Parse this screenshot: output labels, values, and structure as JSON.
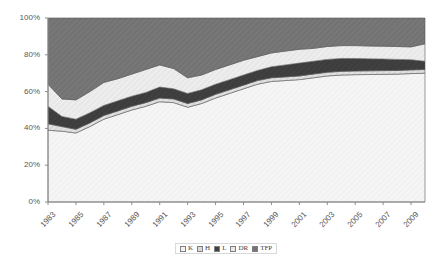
{
  "chart_data": {
    "type": "area",
    "stacked": true,
    "title": "",
    "xlabel": "",
    "ylabel": "",
    "ylim": [
      0,
      100
    ],
    "ytick_labels": [
      "0%",
      "20%",
      "40%",
      "60%",
      "80%",
      "100%"
    ],
    "ytick_values": [
      0,
      20,
      40,
      60,
      80,
      100
    ],
    "grid": false,
    "legend_position": "bottom",
    "x": [
      1983,
      1984,
      1985,
      1986,
      1987,
      1988,
      1989,
      1990,
      1991,
      1992,
      1993,
      1994,
      1995,
      1996,
      1997,
      1998,
      1999,
      2000,
      2001,
      2002,
      2003,
      2004,
      2005,
      2006,
      2007,
      2008,
      2009,
      2010
    ],
    "xtick_labels": [
      "1983",
      "1985",
      "1987",
      "1989",
      "1991",
      "1993",
      "1995",
      "1997",
      "1999",
      "2001",
      "2003",
      "2005",
      "2007",
      "2009"
    ],
    "series": [
      {
        "name": "K",
        "color": "#f2f2f2",
        "values": [
          39.0,
          38.5,
          37.5,
          41.0,
          45.0,
          47.5,
          50.0,
          52.0,
          54.5,
          54.0,
          51.5,
          53.5,
          56.5,
          59.0,
          61.5,
          64.0,
          65.5,
          66.0,
          66.5,
          67.5,
          68.5,
          69.0,
          69.2,
          69.3,
          69.4,
          69.5,
          69.8,
          70.0
        ]
      },
      {
        "name": "H",
        "color": "#d9d9d9",
        "values": [
          3.5,
          2.5,
          2.0,
          2.0,
          2.0,
          2.0,
          2.0,
          2.0,
          2.0,
          2.0,
          2.0,
          2.0,
          2.0,
          2.0,
          2.0,
          2.0,
          2.0,
          2.0,
          2.0,
          2.0,
          2.0,
          2.0,
          2.0,
          2.0,
          2.0,
          2.0,
          2.0,
          2.0
        ]
      },
      {
        "name": "L",
        "color": "#404040",
        "values": [
          9.5,
          5.5,
          5.5,
          5.5,
          5.5,
          5.5,
          5.5,
          5.5,
          6.0,
          5.5,
          5.5,
          5.5,
          5.5,
          5.5,
          5.5,
          5.5,
          6.0,
          6.5,
          7.0,
          7.0,
          7.0,
          7.0,
          6.8,
          6.5,
          6.3,
          6.0,
          5.5,
          4.5
        ]
      },
      {
        "name": "DR",
        "color": "#e8e8e8",
        "values": [
          12.0,
          9.5,
          10.5,
          11.5,
          12.5,
          12.0,
          12.0,
          12.5,
          12.0,
          11.0,
          8.5,
          8.0,
          8.0,
          8.0,
          8.0,
          7.5,
          7.5,
          7.5,
          7.5,
          7.0,
          7.0,
          7.0,
          7.0,
          7.0,
          7.0,
          7.0,
          7.0,
          9.5
        ]
      },
      {
        "name": "TFP",
        "color": "#737373",
        "values": [
          36.0,
          44.0,
          44.5,
          40.0,
          35.0,
          33.0,
          30.5,
          28.0,
          25.5,
          27.5,
          32.5,
          31.0,
          28.0,
          25.5,
          23.0,
          21.0,
          19.0,
          18.0,
          17.0,
          16.5,
          15.5,
          15.0,
          15.0,
          15.2,
          15.3,
          15.5,
          15.7,
          14.0
        ]
      }
    ]
  },
  "legend": {
    "items": [
      {
        "label": "K"
      },
      {
        "label": "H"
      },
      {
        "label": "L"
      },
      {
        "label": "DR"
      },
      {
        "label": "TFP"
      }
    ]
  }
}
